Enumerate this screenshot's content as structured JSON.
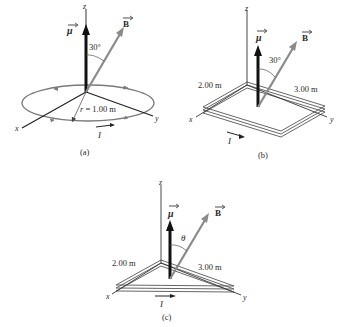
{
  "figure": {
    "panels": [
      {
        "id": "a",
        "caption": "(a)",
        "axes": {
          "x": "x",
          "y": "y",
          "z": "z"
        },
        "mu_label": "μ",
        "b_label": "B",
        "angle_label": "30°",
        "radius_label": "r = 1.00 m",
        "current_label": "I",
        "shape": "circular loop"
      },
      {
        "id": "b",
        "caption": "(b)",
        "axes": {
          "x": "x",
          "y": "y",
          "z": "z"
        },
        "mu_label": "μ",
        "b_label": "B",
        "angle_label": "30°",
        "side1_label": "2.00 m",
        "side2_label": "3.00 m",
        "current_label": "I",
        "shape": "rectangular coil"
      },
      {
        "id": "c",
        "caption": "(c)",
        "axes": {
          "x": "x",
          "y": "y",
          "z": "z"
        },
        "mu_label": "μ",
        "b_label": "B",
        "angle_label": "θ",
        "side1_label": "2.00 m",
        "side2_label": "3.00 m",
        "current_label": "I",
        "shape": "triangular coil"
      }
    ],
    "colors": {
      "axis": "#333333",
      "mu_arrow": "#111111",
      "b_arrow": "#8a8a8a",
      "loop": "#7a7a7a"
    }
  }
}
